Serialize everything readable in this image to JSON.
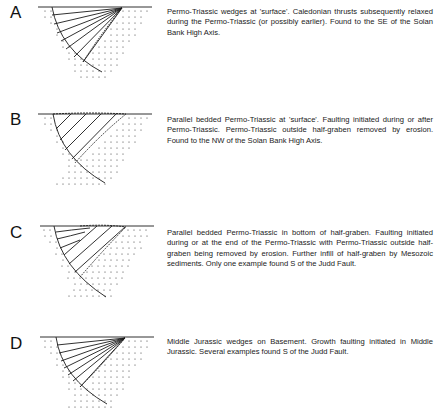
{
  "figure": {
    "panels": [
      {
        "letter": "A",
        "type": "wedge-converging",
        "caption": "Permo-Triassic wedges at 'surface'. Caledonian thrusts subsequently relaxed during the Permo-Triassic (or possibly earlier). Found to the SE of the Solan Bank High Axis."
      },
      {
        "letter": "B",
        "type": "parallel-bedded-full",
        "caption": "Parallel bedded Permo-Triassic at 'surface'. Faulting initiated during or after Permo-Triassic. Permo-Triassic outside half-graben removed by erosion. Found to the NW of the Solan Bank High Axis."
      },
      {
        "letter": "C",
        "type": "parallel-bedded-with-infill",
        "caption": "Parallel bedded Permo-Triassic in bottom of half-graben. Faulting initiated during or at the end of the Permo-Triassic with Permo-Triassic outside half-graben being removed by erosion. Further infill of half-graben by Mesozoic sediments. Only one example found S of the Judd Fault."
      },
      {
        "letter": "D",
        "type": "wedge-converging",
        "caption": "Middle Jurassic wedges on Basement. Growth faulting initiated in Middle Jurassic. Several examples found S of the Judd Fault."
      }
    ],
    "colors": {
      "ink": "#1a1a1a",
      "background": "#ffffff"
    }
  }
}
